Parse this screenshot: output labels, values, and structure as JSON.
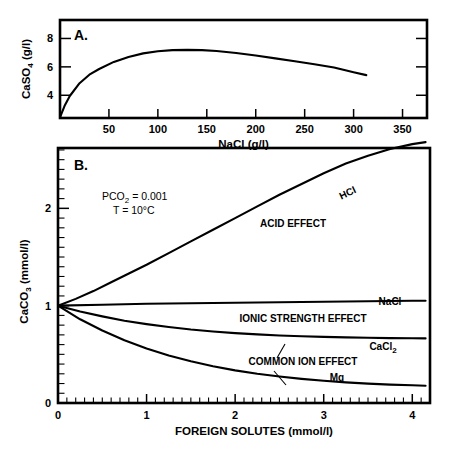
{
  "figure": {
    "background": "#ffffff",
    "ink": "#000000"
  },
  "chart_data": [
    {
      "type": "line",
      "panel": "A",
      "panel_letter": "A.",
      "title": "",
      "xlabel": "NaCl (g/l)",
      "ylabel": "CaSO4 (g/l)",
      "ylabel_parts": {
        "pre": "CaSO",
        "sub": "4",
        "post": " (g/l)"
      },
      "xlim": [
        0,
        375
      ],
      "ylim": [
        2.4,
        9.3
      ],
      "xticks": [
        50,
        100,
        150,
        200,
        250,
        300,
        350
      ],
      "xtick_labels": [
        "50",
        "100",
        "150",
        "200",
        "250",
        "300",
        "350"
      ],
      "yticks": [
        4,
        6,
        8
      ],
      "ytick_labels": [
        "4",
        "6",
        "8"
      ],
      "grid": false,
      "legend": "none",
      "series": [
        {
          "name": "CaSO4 solubility",
          "x": [
            0,
            5,
            10,
            20,
            30,
            40,
            55,
            70,
            85,
            100,
            115,
            130,
            145,
            160,
            180,
            200,
            220,
            240,
            260,
            280,
            300,
            313
          ],
          "y": [
            2.45,
            3.3,
            3.95,
            4.85,
            5.45,
            5.85,
            6.35,
            6.7,
            6.95,
            7.1,
            7.18,
            7.2,
            7.18,
            7.12,
            6.98,
            6.8,
            6.6,
            6.4,
            6.18,
            5.95,
            5.62,
            5.42
          ]
        }
      ]
    },
    {
      "type": "line",
      "panel": "B",
      "panel_letter": "B.",
      "title": "",
      "xlabel": "FOREIGN  SOLUTES (mmol/l)",
      "ylabel": "CaCO3 (mmol/l)",
      "ylabel_parts": {
        "pre": "CaCO",
        "sub": "3",
        "post": " (mmol/l)"
      },
      "xlim": [
        0,
        4.2
      ],
      "ylim": [
        0,
        2.62
      ],
      "xticks": [
        0,
        1,
        2,
        3,
        4
      ],
      "xtick_labels": [
        "0",
        "1",
        "2",
        "3",
        "4"
      ],
      "xminor_step": 0.1,
      "yticks": [
        0,
        1,
        2
      ],
      "ytick_labels": [
        "0",
        "1",
        "2"
      ],
      "yminor_step": 0.1,
      "grid": false,
      "legend": "inline-curve-labels",
      "conditions": [
        {
          "label": "PCO2 = 0.001",
          "parts": {
            "pre": "PCO",
            "sub": "2",
            "post": " =  0.001"
          }
        },
        {
          "label": "T    =  10°C",
          "parts": {
            "pre": "T",
            "sub": "",
            "post": "    =  10°C"
          }
        }
      ],
      "annotations": [
        {
          "text": "ACID  EFFECT",
          "name": "acid-effect"
        },
        {
          "text": "IONIC  STRENGTH  EFFECT",
          "name": "ionic-strength-effect"
        },
        {
          "text": "COMMON  ION  EFFECT",
          "name": "common-ion-effect"
        }
      ],
      "series": [
        {
          "name": "HCl",
          "label": "HCl",
          "x": [
            0,
            0.2,
            0.4,
            0.6,
            0.8,
            1.0,
            1.25,
            1.5,
            1.75,
            2.0,
            2.25,
            2.5,
            2.75,
            3.0,
            3.25,
            3.5,
            3.75,
            4.0,
            4.15
          ],
          "y": [
            1.0,
            1.07,
            1.15,
            1.24,
            1.33,
            1.42,
            1.54,
            1.66,
            1.78,
            1.9,
            2.02,
            2.14,
            2.25,
            2.36,
            2.46,
            2.54,
            2.61,
            2.66,
            2.68
          ]
        },
        {
          "name": "NaCl",
          "label": "NaCl",
          "x": [
            0,
            0.5,
            1.0,
            1.5,
            2.0,
            2.5,
            3.0,
            3.5,
            4.0,
            4.15
          ],
          "y": [
            1.0,
            1.01,
            1.02,
            1.025,
            1.03,
            1.035,
            1.04,
            1.045,
            1.05,
            1.05
          ]
        },
        {
          "name": "CaCl2",
          "label": "CaCl2",
          "label_parts": {
            "pre": "CaCl",
            "sub": "2"
          },
          "x": [
            0,
            0.25,
            0.5,
            0.75,
            1.0,
            1.25,
            1.5,
            1.75,
            2.0,
            2.25,
            2.5,
            2.75,
            3.0,
            3.25,
            3.5,
            3.75,
            4.0,
            4.15
          ],
          "y": [
            1.0,
            0.94,
            0.89,
            0.845,
            0.81,
            0.78,
            0.755,
            0.735,
            0.718,
            0.705,
            0.694,
            0.686,
            0.679,
            0.674,
            0.67,
            0.667,
            0.665,
            0.664
          ]
        },
        {
          "name": "Mg",
          "label": "Mg",
          "x": [
            0,
            0.25,
            0.5,
            0.75,
            1.0,
            1.25,
            1.5,
            1.75,
            2.0,
            2.25,
            2.5,
            2.75,
            3.0,
            3.25,
            3.5,
            3.75,
            4.0,
            4.15
          ],
          "y": [
            1.0,
            0.86,
            0.745,
            0.645,
            0.56,
            0.488,
            0.428,
            0.378,
            0.335,
            0.3,
            0.272,
            0.248,
            0.228,
            0.212,
            0.199,
            0.189,
            0.182,
            0.178
          ]
        }
      ]
    }
  ]
}
